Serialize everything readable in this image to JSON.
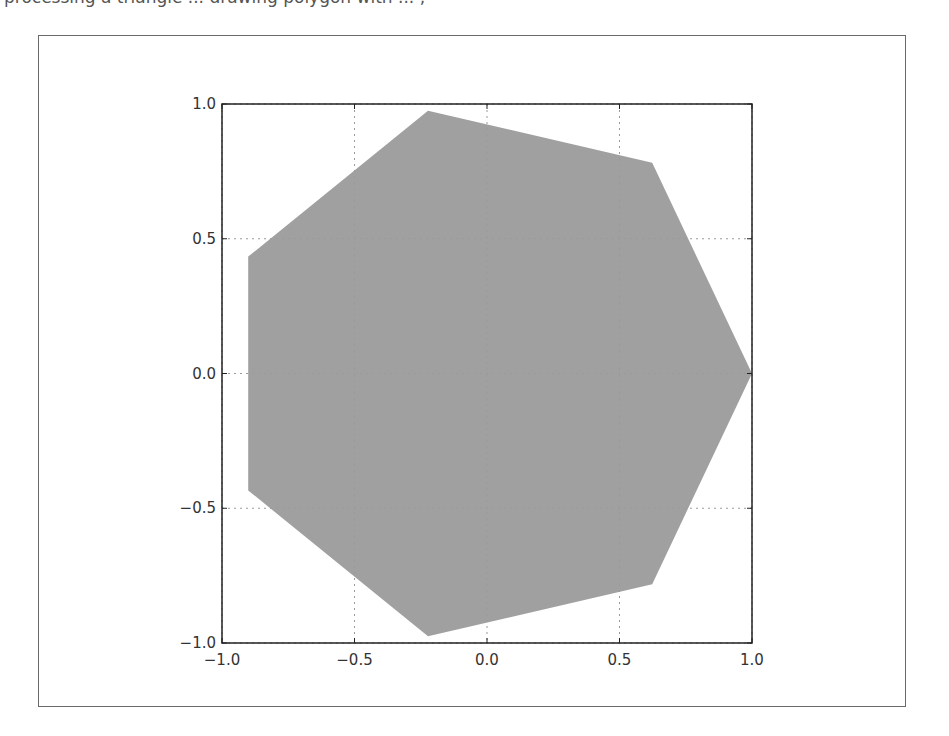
{
  "header": {
    "clipped_caption": "processing a triangle ... drawing polygon with ... ,"
  },
  "chart_data": {
    "type": "area",
    "title": "",
    "xlabel": "",
    "ylabel": "",
    "xlim": [
      -1.0,
      1.0
    ],
    "ylim": [
      -1.0,
      1.0
    ],
    "grid": true,
    "legend": null,
    "x_ticks": [
      "-1.0",
      "-0.5",
      "0.0",
      "0.5",
      "1.0"
    ],
    "y_ticks": [
      "-1.0",
      "-0.5",
      "0.0",
      "0.5",
      "1.0"
    ],
    "series": [
      {
        "name": "regular heptagon",
        "fill_color": "#a0a0a0",
        "x": [
          1.0,
          0.6235,
          -0.2225,
          -0.901,
          -0.901,
          -0.2225,
          0.6235
        ],
        "y": [
          0.0,
          0.7818,
          0.9749,
          0.4339,
          -0.4339,
          -0.9749,
          -0.7818
        ]
      }
    ]
  },
  "style": {
    "axes_color": "#222222",
    "grid_color": "#9a9a9a",
    "fill_color": "#a0a0a0",
    "frame_color": "#6a6a6a"
  }
}
